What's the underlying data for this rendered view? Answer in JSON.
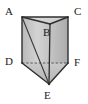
{
  "figure": {
    "name": "triangular-prism",
    "background_color": "#ffffff",
    "stroke_color": "#333333",
    "hidden_edge_style": "dashed",
    "canvas": {
      "width": 88,
      "height": 104
    }
  },
  "labels": {
    "a": "A",
    "b": "B",
    "c": "C",
    "d": "D",
    "e": "E",
    "f": "F"
  },
  "vertices": [
    {
      "id": "A",
      "x": 22,
      "y": 17,
      "label": "A",
      "label_x": 5,
      "label_y": 6
    },
    {
      "id": "B",
      "x": 50,
      "y": 24,
      "label": "B",
      "label_x": 43,
      "label_y": 27
    },
    {
      "id": "C",
      "x": 68,
      "y": 17,
      "label": "C",
      "label_x": 74,
      "label_y": 6
    },
    {
      "id": "D",
      "x": 22,
      "y": 63,
      "label": "D",
      "label_x": 5,
      "label_y": 56
    },
    {
      "id": "E",
      "x": 49,
      "y": 84,
      "label": "E",
      "label_x": 44,
      "label_y": 90
    },
    {
      "id": "F",
      "x": 68,
      "y": 63,
      "label": "F",
      "label_x": 74,
      "label_y": 57
    }
  ],
  "faces": [
    {
      "id": "top-triangle-ABC",
      "points": "22,17 68,17 50,24",
      "fill": "#d6d6d6"
    },
    {
      "id": "left-face-ADEB",
      "points": "22,17 50,24 49,84 22,63",
      "fill": "#c9c9c9"
    },
    {
      "id": "right-face-BEFC",
      "points": "50,24 68,17 68,63 49,84",
      "fill": "#bdbdbd"
    },
    {
      "id": "front-face-ADEF",
      "points": "22,17 22,63 49,84 68,63 68,17",
      "fill": "#cccccc"
    }
  ],
  "edges": [
    {
      "id": "edge-AC",
      "from": "A",
      "to": "C",
      "hidden": false
    },
    {
      "id": "edge-AB",
      "from": "A",
      "to": "B",
      "hidden": false
    },
    {
      "id": "edge-BC",
      "from": "B",
      "to": "C",
      "hidden": false
    },
    {
      "id": "edge-AD",
      "from": "A",
      "to": "D",
      "hidden": false
    },
    {
      "id": "edge-BE",
      "from": "B",
      "to": "E",
      "hidden": false
    },
    {
      "id": "edge-CF",
      "from": "C",
      "to": "F",
      "hidden": false
    },
    {
      "id": "edge-DE",
      "from": "D",
      "to": "E",
      "hidden": false
    },
    {
      "id": "edge-EF",
      "from": "E",
      "to": "F",
      "hidden": false
    },
    {
      "id": "edge-DF",
      "from": "D",
      "to": "F",
      "hidden": true
    },
    {
      "id": "diagonal-AE",
      "from": "A",
      "to": "E",
      "hidden": false
    }
  ]
}
